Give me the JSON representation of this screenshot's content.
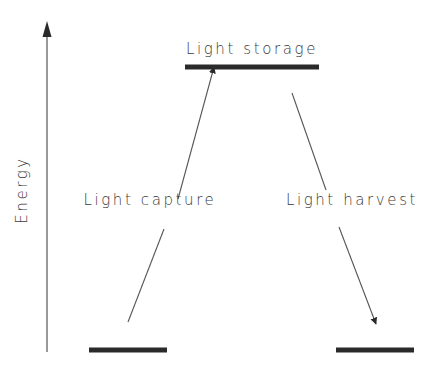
{
  "diagram": {
    "axis": {
      "label": "Energy",
      "direction": "up"
    },
    "levels": [
      {
        "id": "ground-left",
        "label": ""
      },
      {
        "id": "storage",
        "label": "Light storage"
      },
      {
        "id": "ground-right",
        "label": ""
      }
    ],
    "transitions": [
      {
        "id": "capture",
        "label": "Light capture",
        "from": "ground-left",
        "to": "storage"
      },
      {
        "id": "harvest",
        "label": "Light harvest",
        "from": "storage",
        "to": "ground-right"
      }
    ],
    "colors": {
      "ink": "#2a2a2a",
      "line": "#555555",
      "background": "#ffffff"
    }
  }
}
